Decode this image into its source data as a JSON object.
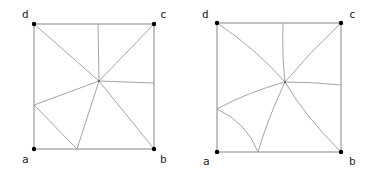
{
  "diagrams": [
    {
      "name": "straight-subdivision",
      "labels": {
        "a": "a",
        "b": "b",
        "c": "c",
        "d": "d"
      }
    },
    {
      "name": "curved-subdivision",
      "labels": {
        "a": "a",
        "b": "b",
        "c": "c",
        "d": "d"
      }
    }
  ],
  "colors": {
    "edge": "#9a9a9a",
    "vertex": "#000000",
    "label": "#222222"
  }
}
